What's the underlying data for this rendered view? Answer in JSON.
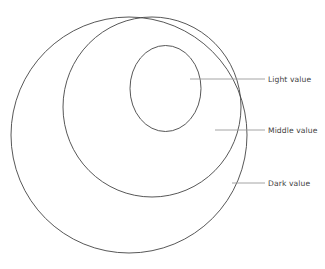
{
  "diagram": {
    "type": "value-sphere-shading-diagram",
    "background_color": "#ffffff",
    "outline_color": "#444444",
    "leader_color": "#9a9a9a",
    "text_color": "#3c3c3c",
    "shapes": {
      "outer_circle": {
        "name": "dark-value-circle",
        "cx": 129,
        "cy": 135,
        "r": 118
      },
      "middle_circle": {
        "name": "middle-value-circle",
        "cx": 152,
        "cy": 107,
        "rx": 89,
        "ry": 90
      },
      "inner_circle": {
        "name": "light-value-circle",
        "cx": 165.5,
        "cy": 88.5,
        "rx": 35.5,
        "ry": 43
      }
    },
    "annotations": [
      {
        "id": "light-value",
        "label": "Light value",
        "leader": {
          "x1": 190,
          "y1": 79,
          "x2": 265,
          "y2": 79
        }
      },
      {
        "id": "middle-value",
        "label": "Middle value",
        "leader": {
          "x1": 215,
          "y1": 130,
          "x2": 265,
          "y2": 130
        }
      },
      {
        "id": "dark-value",
        "label": "Dark value",
        "leader": {
          "x1": 232,
          "y1": 183,
          "x2": 265,
          "y2": 183
        }
      }
    ]
  }
}
